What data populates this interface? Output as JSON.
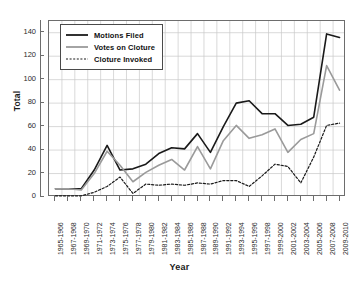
{
  "chart_data": {
    "type": "line",
    "title": "",
    "xlabel": "Year",
    "ylabel": "Total",
    "ylim": [
      0,
      150
    ],
    "yticks": [
      0,
      20,
      40,
      60,
      80,
      100,
      120,
      140
    ],
    "grid": true,
    "legend_position": "top-left",
    "categories": [
      "1965-1966",
      "1967-1968",
      "1969-1970",
      "1971-1972",
      "1973-1974",
      "1975-1976",
      "1977-1978",
      "1979-1980",
      "1981-1982",
      "1983-1984",
      "1985-1986",
      "1987-1988",
      "1989-1990",
      "1991-1992",
      "1993-1994",
      "1995-1996",
      "1997-1998",
      "1999-2000",
      "2001-2002",
      "2003-2004",
      "2005-2006",
      "2007-2008",
      "2009-2010"
    ],
    "series": [
      {
        "name": "Motions Filed",
        "style": "solid",
        "color": "#1a1a1a",
        "values": [
          7,
          7,
          7,
          23,
          44,
          23,
          24,
          28,
          37,
          42,
          41,
          54,
          38,
          60,
          80,
          82,
          71,
          71,
          61,
          62,
          68,
          139,
          136
        ]
      },
      {
        "name": "Votes on Cloture",
        "style": "solid",
        "color": "#9a9a9a",
        "values": [
          7,
          7,
          6,
          20,
          39,
          27,
          13,
          21,
          27,
          32,
          23,
          43,
          24,
          48,
          61,
          50,
          53,
          58,
          38,
          49,
          54,
          112,
          91
        ]
      },
      {
        "name": "Cloture Invoked",
        "style": "dotted",
        "color": "#1a1a1a",
        "values": [
          1,
          1,
          1,
          4,
          9,
          17,
          3,
          11,
          10,
          11,
          10,
          12,
          11,
          14,
          14,
          9,
          18,
          28,
          26,
          12,
          34,
          61,
          63
        ]
      }
    ]
  },
  "legend": {
    "items": [
      {
        "label": "Motions Filed"
      },
      {
        "label": "Votes on Cloture"
      },
      {
        "label": "Cloture Invoked"
      }
    ]
  }
}
